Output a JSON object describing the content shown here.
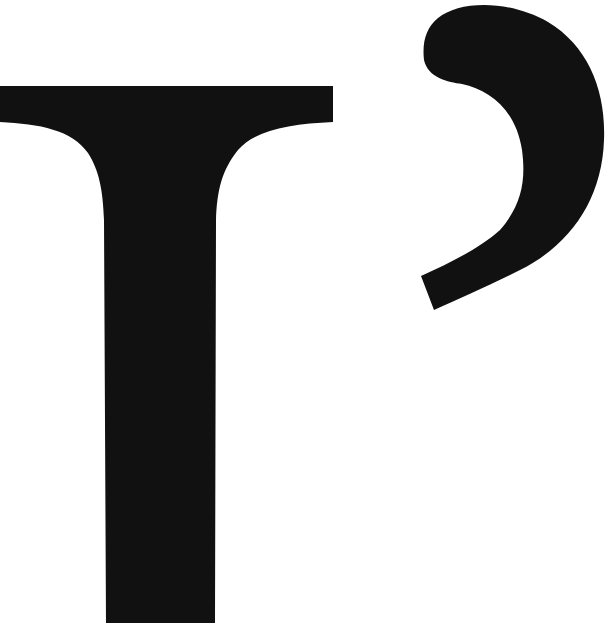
{
  "image": {
    "description": "Large black glyphs: a serif capital T and a right single quotation mark (apostrophe) on a white background",
    "glyphs": [
      {
        "char": "T",
        "name": "capital-letter-t"
      },
      {
        "char": "’",
        "name": "apostrophe"
      }
    ],
    "text": "T’",
    "colors": {
      "ink": "#111111",
      "background": "#ffffff"
    }
  }
}
